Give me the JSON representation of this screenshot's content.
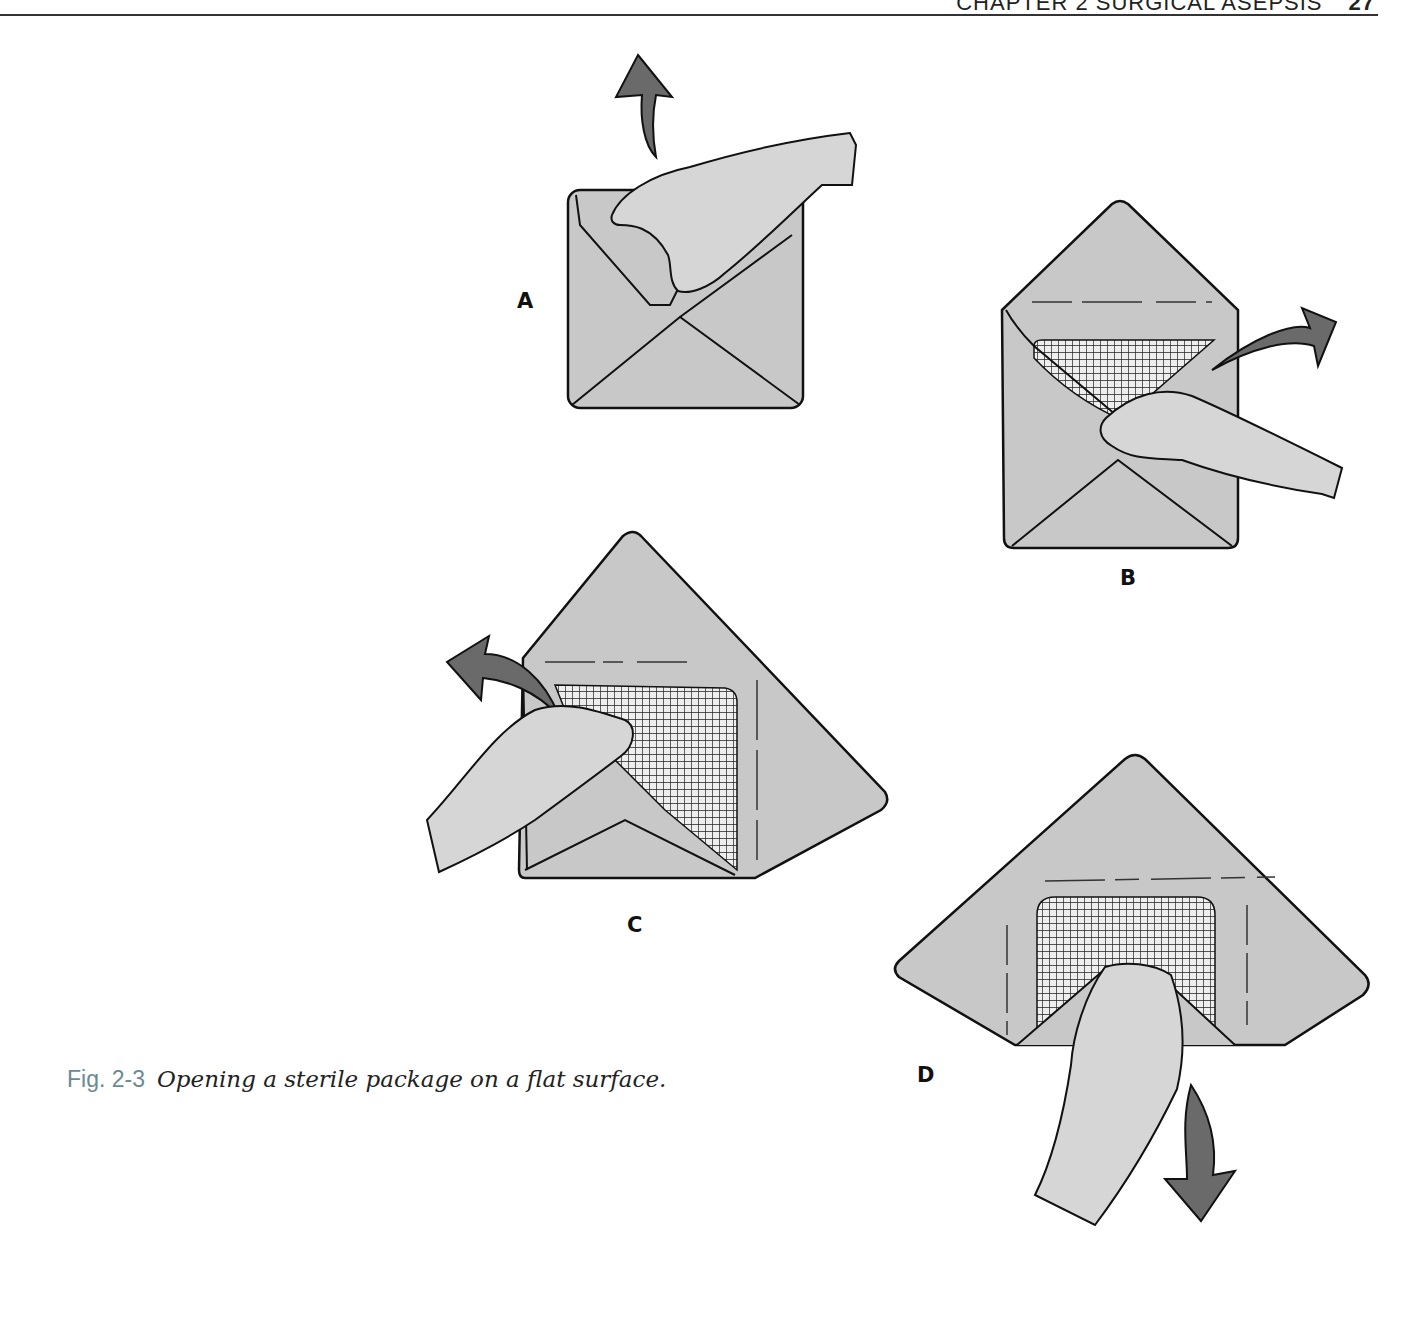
{
  "running_head": {
    "chapter": "CHAPTER 2 SURGICAL ASEPSIS",
    "page_number": "27"
  },
  "figure": {
    "number": "Fig. 2-3",
    "caption": "Opening a sterile package on a flat surface.",
    "panels": [
      {
        "label": "A",
        "description": "Hand grasping top flap of folded wrapper; arrow pointing up/away"
      },
      {
        "label": "B",
        "description": "Right-side flap pulled open to the right; gauze partially visible"
      },
      {
        "label": "C",
        "description": "Left-side flap pulled open to the left"
      },
      {
        "label": "D",
        "description": "Nearest flap pulled down toward the body; gauze fully exposed"
      }
    ]
  },
  "colors": {
    "wrapper_fill": "#c8c8c8",
    "skin_fill": "#d6d6d6",
    "arrow_fill": "#6a6a6a",
    "outline": "#111111",
    "fig_label": "#6b8a92"
  }
}
